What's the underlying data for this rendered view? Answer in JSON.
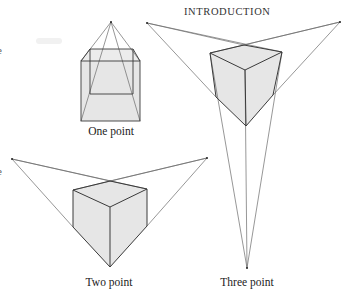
{
  "page": {
    "running_header": "INTRODUCTION",
    "left_margin_fragments": [
      "e",
      "e"
    ]
  },
  "figure": {
    "colors": {
      "line": "#3a3a3a",
      "construction_line": "#6a6a6a",
      "face_fill": "#e6e6e6",
      "background": "#ffffff"
    },
    "panels": [
      {
        "id": "one-point",
        "caption": "One point",
        "vanishing_points": [
          [
            111,
            22
          ]
        ],
        "front_face": [
          [
            81,
            61
          ],
          [
            140,
            61
          ],
          [
            140,
            121
          ],
          [
            81,
            121
          ]
        ],
        "back_face": [
          [
            90,
            49
          ],
          [
            133,
            49
          ],
          [
            133,
            94
          ],
          [
            90,
            94
          ]
        ]
      },
      {
        "id": "two-point",
        "caption": "Two point",
        "vanishing_points": [
          [
            12,
            159
          ],
          [
            207,
            158
          ]
        ],
        "vertices": {
          "top": [
            110,
            181
          ],
          "left": [
            73,
            190
          ],
          "right": [
            147,
            189
          ],
          "center": [
            110,
            207
          ],
          "left_bottom": [
            73,
            227
          ],
          "right_bottom": [
            147,
            226
          ],
          "bottom": [
            110,
            267
          ]
        }
      },
      {
        "id": "three-point",
        "caption": "Three point",
        "vanishing_points": [
          [
            147,
            23
          ],
          [
            340,
            22
          ],
          [
            247,
            268
          ]
        ],
        "vertices": {
          "top": [
            244,
            45
          ],
          "left": [
            210,
            53
          ],
          "right": [
            282,
            52
          ],
          "center": [
            245,
            70
          ],
          "left_bottom": [
            216,
            97
          ],
          "right_bottom": [
            273,
            95
          ],
          "bottom": [
            246,
            126
          ]
        }
      }
    ]
  }
}
